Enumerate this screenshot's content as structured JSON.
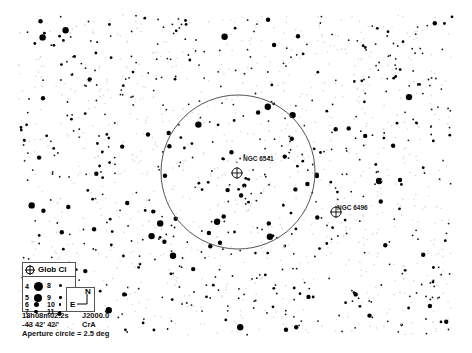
{
  "map": {
    "field": {
      "x": 18,
      "y": 15,
      "width": 434,
      "height": 320
    },
    "aperture_circle": {
      "cx": 238,
      "cy": 172,
      "r": 77,
      "color": "#555555"
    },
    "objects": [
      {
        "name": "NGC 6541",
        "type": "Glob Cl",
        "x": 237,
        "y": 173,
        "label_x": 243,
        "label_y": 160
      },
      {
        "name": "NGC 6496",
        "type": "Glob Cl",
        "x": 336,
        "y": 212,
        "label_x": 337,
        "label_y": 209
      }
    ]
  },
  "legend": {
    "title": "Glob Cl",
    "magnitudes": [
      {
        "mag": "4",
        "size": 7
      },
      {
        "mag": "5",
        "size": 6
      },
      {
        "mag": "6",
        "size": 4
      },
      {
        "mag": "7",
        "size": 3
      },
      {
        "mag": "8",
        "size": 2.5
      },
      {
        "mag": "9",
        "size": 2
      },
      {
        "mag": "10",
        "size": 1.6
      },
      {
        "mag": "11",
        "size": 1.2
      }
    ]
  },
  "compass": {
    "north": "N",
    "east": "E"
  },
  "info": {
    "ra": "18h08m02.2s",
    "epoch": "J2000.0",
    "dec": "-43 42' 42\"",
    "constellation": "CrA",
    "aperture": "Aperture circle = 2.5 deg"
  }
}
